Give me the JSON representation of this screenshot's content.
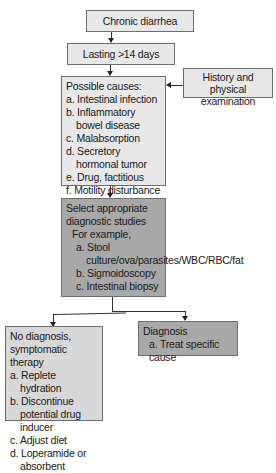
{
  "flowchart": {
    "start": {
      "label": "Chronic diarrhea"
    },
    "duration": {
      "label": "Lasting >14 days"
    },
    "causes": {
      "title": "Possible causes:",
      "items": [
        "a. Intestinal infection",
        "b. Inflammatory bowel disease",
        "c. Malabsorption",
        "d. Secretory hormonal tumor",
        "e. Drug, factitious",
        "f. Motility disturbance"
      ]
    },
    "history": {
      "label": "History and physical examination"
    },
    "studies": {
      "title": "Select appropriate diagnostic studies",
      "subtitle": "For example,",
      "items": [
        "a. Stool culture/ova/parasites/WBC/RBC/fat",
        "b. Sigmoidoscopy",
        "c. Intestinal biopsy"
      ]
    },
    "no_diagnosis": {
      "title": "No diagnosis, symptomatic therapy",
      "items": [
        "a. Replete hydration",
        "b. Discontinue potential drug inducer",
        "c. Adjust diet",
        "d. Loperamide or absorbent"
      ]
    },
    "diagnosis": {
      "title": "Diagnosis",
      "items": [
        "a. Treat specific cause"
      ]
    }
  },
  "colors": {
    "light_box": "#e8e8e8",
    "dark_box": "#a8a8a8",
    "line": "#333333"
  }
}
